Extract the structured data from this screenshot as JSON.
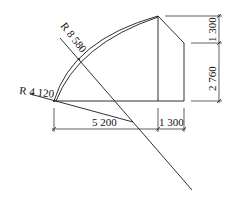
{
  "diagram": {
    "type": "architectural-section-dimensioned",
    "labels": {
      "radius_large": "R 8 580",
      "radius_small": "R 4 120"
    },
    "dimensions": {
      "horizontal_left": "5 200",
      "horizontal_right": "1 300",
      "vertical_top": "1 300",
      "vertical_bottom": "2 760"
    },
    "colors": {
      "line": "#1a1a1a",
      "background": "#ffffff"
    }
  }
}
